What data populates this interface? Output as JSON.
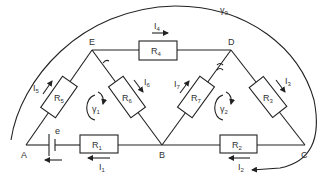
{
  "diagram": {
    "type": "electrical circuit",
    "nodes": {
      "A": "A",
      "B": "B",
      "C": "C",
      "D": "D",
      "E": "E"
    },
    "source": {
      "label": "e"
    },
    "resistors": {
      "R1": {
        "main": "R",
        "sub": "1"
      },
      "R2": {
        "main": "R",
        "sub": "2"
      },
      "R3": {
        "main": "R",
        "sub": "3"
      },
      "R4": {
        "main": "R",
        "sub": "4"
      },
      "R5": {
        "main": "R",
        "sub": "5"
      },
      "R6": {
        "main": "R",
        "sub": "6"
      },
      "R7": {
        "main": "R",
        "sub": "7"
      }
    },
    "currents": {
      "I1": {
        "main": "I",
        "sub": "1"
      },
      "I2": {
        "main": "I",
        "sub": "2"
      },
      "I3": {
        "main": "I",
        "sub": "3"
      },
      "I4": {
        "main": "I",
        "sub": "4"
      },
      "I5": {
        "main": "I",
        "sub": "5"
      },
      "I6": {
        "main": "I",
        "sub": "6"
      },
      "I7": {
        "main": "I",
        "sub": "7"
      }
    },
    "loops": {
      "y1": {
        "main": "γ",
        "sub": "1"
      },
      "y2": {
        "main": "γ",
        "sub": "2"
      },
      "y3": {
        "main": "γ",
        "sub": "3"
      }
    }
  }
}
